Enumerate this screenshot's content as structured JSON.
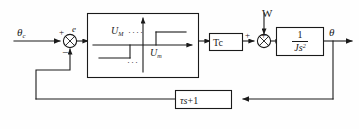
{
  "diagram": {
    "type": "control-block-diagram",
    "stroke_color": "#1a1a1a",
    "background_color": "#fefefe",
    "signals": {
      "reference_input": "θ",
      "reference_input_subscript": "c",
      "error": "e",
      "disturbance": "W",
      "output": "θ"
    },
    "summing_junctions": [
      {
        "name": "error-summing-junction",
        "inputs": [
          "+",
          "−"
        ],
        "output_label": "e",
        "plus_sign": "+",
        "minus_sign": "−"
      },
      {
        "name": "disturbance-summing-junction",
        "inputs": [
          "+",
          "+"
        ],
        "left_sign": "+",
        "top_sign": "+"
      }
    ],
    "blocks": [
      {
        "name": "nonlinearity-block",
        "kind": "hysteresis-relay-characteristic",
        "upper_level_label": "U",
        "upper_level_subscript": "M",
        "lower_level_label": "U",
        "lower_level_subscript": "m",
        "dots_upper": "····",
        "dots_lower": "···"
      },
      {
        "name": "gain-block",
        "label": "Tc"
      },
      {
        "name": "plant-block",
        "numerator": "1",
        "denominator_base": "Js",
        "denominator_exponent": "2"
      },
      {
        "name": "feedback-block",
        "base": "τs",
        "plus": "+",
        "constant": "1"
      }
    ]
  }
}
